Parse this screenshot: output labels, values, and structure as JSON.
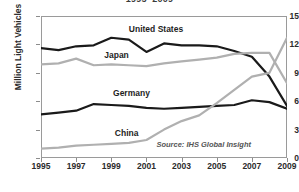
{
  "chart_data": {
    "type": "line",
    "title": "1995–2009",
    "subtitle": "",
    "xlabel": "",
    "ylabel": "Million Light Vehicles",
    "source": "Source: IHS Global Insight",
    "grid": false,
    "legend_position": "inline-labels",
    "xlim": [
      1995,
      2009
    ],
    "ylim": [
      0,
      15
    ],
    "x": [
      1995,
      1996,
      1997,
      1998,
      1999,
      2000,
      2001,
      2002,
      2003,
      2004,
      2005,
      2006,
      2007,
      2008,
      2009
    ],
    "xticks": [
      "1995",
      "1997",
      "1999",
      "2001",
      "2003",
      "2005",
      "2007",
      "2009"
    ],
    "xtick_values": [
      1995,
      1997,
      1999,
      2001,
      2003,
      2005,
      2007,
      2009
    ],
    "yticks": [
      "0",
      "3",
      "6",
      "9",
      "12",
      "15"
    ],
    "ytick_values": [
      0,
      3,
      6,
      9,
      12,
      15
    ],
    "series": [
      {
        "name": "United States",
        "color": "#1a1a1a",
        "width": 2.2,
        "label_x": 2000.0,
        "label_y": 13.6,
        "values": [
          11.6,
          11.4,
          11.8,
          11.9,
          12.7,
          12.5,
          11.2,
          12.1,
          11.9,
          11.9,
          11.8,
          11.3,
          10.7,
          8.6,
          5.5
        ]
      },
      {
        "name": "Japan",
        "color": "#b0b0b0",
        "width": 2.2,
        "label_x": 1998.6,
        "label_y": 10.9,
        "values": [
          9.9,
          10.0,
          10.5,
          9.8,
          9.9,
          9.8,
          9.7,
          10.0,
          10.2,
          10.4,
          10.6,
          11.0,
          11.1,
          11.1,
          7.9
        ]
      },
      {
        "name": "Germany",
        "color": "#1a1a1a",
        "width": 2.2,
        "label_x": 1999.1,
        "label_y": 6.9,
        "values": [
          4.6,
          4.8,
          5.0,
          5.7,
          5.6,
          5.5,
          5.3,
          5.2,
          5.3,
          5.4,
          5.5,
          5.6,
          6.1,
          5.9,
          5.2
        ]
      },
      {
        "name": "China",
        "color": "#b0b0b0",
        "width": 2.2,
        "label_x": 1999.2,
        "label_y": 2.6,
        "values": [
          1.0,
          1.1,
          1.3,
          1.4,
          1.5,
          1.6,
          1.9,
          3.0,
          3.9,
          4.5,
          5.8,
          7.2,
          8.6,
          9.0,
          12.7
        ]
      }
    ]
  },
  "colors": {
    "dark_series": "#1a1a1a",
    "light_series": "#b0b0b0",
    "axis": "#9a9a9a",
    "text": "#2b2b2b",
    "background": "#ffffff"
  }
}
